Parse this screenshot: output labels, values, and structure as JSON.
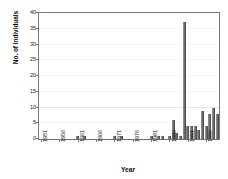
{
  "chart_data": {
    "type": "bar",
    "title": "",
    "xlabel": "Year",
    "ylabel": "No. of Individuals",
    "ylim": [
      0,
      40
    ],
    "ytick_labels": [
      "0",
      "5",
      "10",
      "15",
      "20",
      "25",
      "30",
      "35",
      "40"
    ],
    "ytick_values": [
      0,
      5,
      10,
      15,
      20,
      25,
      30,
      35,
      40
    ],
    "xtick_labels": [
      "1951",
      "1956",
      "1961",
      "1966",
      "1971",
      "1976",
      "1981",
      "1986",
      "1991",
      "1996"
    ],
    "xtick_values": [
      1951,
      1956,
      1961,
      1966,
      1971,
      1976,
      1981,
      1986,
      1991,
      1996
    ],
    "xlim": [
      1950.5,
      1999.5
    ],
    "grid": "horizontal-light",
    "legend": "none",
    "bar_color": "#6b6b6b",
    "categories": [
      1951,
      1952,
      1953,
      1954,
      1955,
      1956,
      1957,
      1958,
      1959,
      1960,
      1961,
      1962,
      1963,
      1964,
      1965,
      1966,
      1967,
      1968,
      1969,
      1970,
      1971,
      1972,
      1973,
      1974,
      1975,
      1976,
      1977,
      1978,
      1979,
      1980,
      1981,
      1982,
      1983,
      1984,
      1985,
      1986,
      1987,
      1988,
      1989,
      1990,
      1991,
      1992,
      1993,
      1994,
      1995,
      1996,
      1997,
      1998,
      1999
    ],
    "values": [
      0,
      0,
      0,
      0,
      0,
      0,
      0,
      0,
      0,
      0,
      1,
      0,
      1,
      0,
      0,
      0,
      0,
      0,
      0,
      0,
      1,
      0,
      1,
      0,
      0,
      0,
      0,
      0,
      0,
      0,
      1,
      0,
      1,
      1,
      0,
      1,
      6,
      2,
      1,
      37,
      4,
      4,
      4,
      3,
      9,
      4,
      8,
      10,
      8
    ]
  },
  "axis": {
    "y_title": "No. of Individuals",
    "x_title": "Year"
  }
}
